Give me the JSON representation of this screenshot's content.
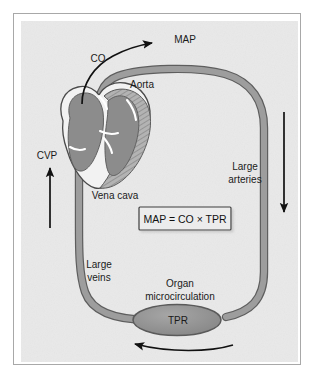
{
  "figure": {
    "background_color": "#e9e9e9",
    "frame_color": "#a8a8a8",
    "vessel_fill": "#9a9a9a",
    "vessel_edge": "#5e5e5e",
    "chamber_fill": "#8a8a8a",
    "muscle_fill": "#b5b5b5",
    "arrow_color": "#111111",
    "text_color": "#1a1a1a"
  },
  "labels": {
    "co": "CO",
    "map": "MAP",
    "aorta": "Aorta",
    "cvp": "CVP",
    "vena_cava": "Vena cava",
    "large_arteries_line1": "Large",
    "large_arteries_line2": "arteries",
    "large_veins_line1": "Large",
    "large_veins_line2": "veins",
    "organ_line1": "Organ",
    "organ_line2": "microcirculation",
    "tpr": "TPR"
  },
  "equation": {
    "text": "MAP = CO × TPR",
    "box_fill": "#ececec",
    "box_border": "#3c3c3c"
  },
  "flow_arrows": [
    {
      "name": "cardiac-output-arrow",
      "label": "CO",
      "direction": "clockwise-up",
      "location": "aortic-outflow"
    },
    {
      "name": "large-arteries-arrow",
      "label": "Large arteries",
      "direction": "down",
      "location": "right-side"
    },
    {
      "name": "microcirculation-arrow",
      "label": "TPR",
      "direction": "left",
      "location": "bottom"
    },
    {
      "name": "central-venous-pressure-arrow",
      "label": "CVP",
      "direction": "up",
      "location": "left-side"
    }
  ]
}
